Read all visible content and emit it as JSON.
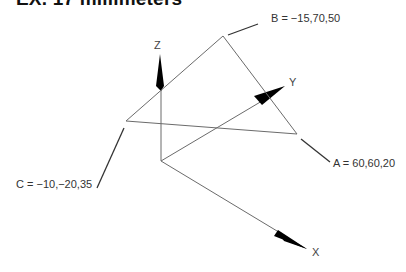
{
  "title": "EX. 17 millimeters",
  "axes": {
    "x": {
      "label": "X"
    },
    "y": {
      "label": "Y"
    },
    "z": {
      "label": "Z"
    }
  },
  "points": [
    {
      "name": "A",
      "label": "A = 60,60,20",
      "coords": [
        60,
        60,
        20
      ]
    },
    {
      "name": "B",
      "label": "B = −15,70,50",
      "coords": [
        -15,
        70,
        50
      ]
    },
    {
      "name": "C",
      "label": "C = −10,−20,35",
      "coords": [
        -10,
        -20,
        35
      ]
    }
  ],
  "colors": {
    "line": "#6b6b6b",
    "arrow": "#000000",
    "text": "#333333"
  }
}
